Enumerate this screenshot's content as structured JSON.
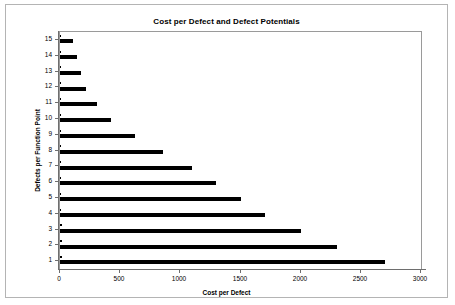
{
  "chart_data": {
    "type": "bar",
    "orientation": "horizontal",
    "title": "Cost per Defect and Defect Potentials",
    "xlabel": "Cost per Defect",
    "ylabel": "Defects per Function Point",
    "categories": [
      "1",
      "2",
      "3",
      "4",
      "5",
      "6",
      "7",
      "8",
      "9",
      "10",
      "11",
      "12",
      "13",
      "14",
      "15"
    ],
    "xlim": [
      0,
      3000
    ],
    "xticks": [
      0,
      500,
      1000,
      1500,
      2000,
      2500,
      3000
    ],
    "xticklabels": [
      "0",
      "500",
      "1000",
      "1500",
      "2000",
      "2500",
      "3000"
    ],
    "grid": false,
    "legend": "none",
    "bar_color": "#000000",
    "series": [
      {
        "name": "Cost per Defect",
        "values": [
          2700,
          2300,
          2000,
          1700,
          1500,
          1300,
          1100,
          860,
          620,
          420,
          310,
          220,
          175,
          145,
          110
        ]
      },
      {
        "name": "Defect Potentials",
        "values": [
          15,
          14,
          13,
          12,
          11,
          10,
          9,
          8,
          7,
          6,
          5,
          4,
          3,
          2,
          1
        ]
      }
    ]
  },
  "axes": {
    "y_tick_labels": [
      "15",
      "14",
      "13",
      "12",
      "11",
      "10",
      "9",
      "8",
      "7",
      "6",
      "5",
      "4",
      "3",
      "2",
      "1"
    ],
    "y_axis_title": "Defects per Function Point",
    "x_axis_title": "Cost per Defect"
  }
}
